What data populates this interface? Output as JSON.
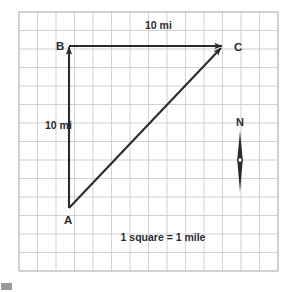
{
  "figure": {
    "type": "vector-diagram",
    "background_color": "#ffffff",
    "grid": {
      "label": "square-grid",
      "x0": 19,
      "y0": 12,
      "cell_size": 18.5,
      "columns": 14,
      "rows": 14,
      "line_color": "#c9c9cf",
      "border_color": "#b8b8c0",
      "scale_note": "1 square = 1 mile"
    },
    "points": [
      {
        "label": "A",
        "x": 69,
        "y": 208,
        "label_x": 64,
        "label_y": 224
      },
      {
        "label": "B",
        "x": 69,
        "y": 46,
        "label_x": 56,
        "label_y": 50
      },
      {
        "label": "C",
        "x": 223,
        "y": 46,
        "label_x": 234,
        "label_y": 51
      }
    ],
    "vectors": [
      {
        "name": "vector-a-to-b",
        "from": "A",
        "to": "B",
        "x1": 69,
        "y1": 208,
        "x2": 69,
        "y2": 47,
        "magnitude_label": "10 mi",
        "label_x": 45,
        "label_y": 129,
        "color": "#2b2b2b"
      },
      {
        "name": "vector-b-to-c",
        "from": "B",
        "to": "C",
        "x1": 69,
        "y1": 46,
        "x2": 222,
        "y2": 46,
        "magnitude_label": "10 mi",
        "label_x": 145,
        "label_y": 29,
        "color": "#2b2b2b"
      },
      {
        "name": "vector-a-to-c",
        "from": "A",
        "to": "C",
        "x1": 69,
        "y1": 208,
        "x2": 221,
        "y2": 48,
        "magnitude_label": "",
        "color": "#2b2b2b"
      }
    ],
    "compass": {
      "name": "compass-north-indicator",
      "label": "N",
      "label_x": 240,
      "label_y": 126,
      "needle_top_y": 131,
      "needle_bottom_y": 192,
      "center_x": 240,
      "center_y": 160,
      "color": "#2b2b2b"
    },
    "caption": {
      "text": "1 square = 1 mile",
      "x": 163,
      "y": 241
    },
    "colors": {
      "ink": "#2b2b2b",
      "grid_line": "#c9c9cf",
      "grid_border": "#b8b8c0",
      "page": "#ffffff",
      "corner_mark": "#9a9a9a"
    }
  }
}
